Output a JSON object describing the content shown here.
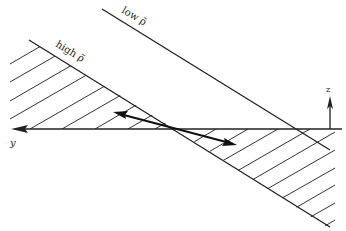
{
  "diagram": {
    "labels": {
      "low": "low ρ̃",
      "high": "high ρ̃",
      "y_axis": "y",
      "z_axis": "z"
    },
    "colors": {
      "line": "#222222",
      "background": "#ffffff"
    }
  }
}
